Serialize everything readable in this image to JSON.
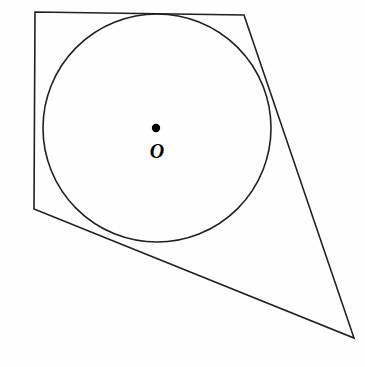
{
  "figure": {
    "background_color": "#fefefe",
    "stroke_color": "#231f20",
    "stroke_width": 1.6,
    "width": 365,
    "height": 367,
    "center_label": "O",
    "center_dot": {
      "label": "O",
      "x": 156,
      "y": 128,
      "radius": 4.2,
      "color": "#000000"
    },
    "circle": {
      "name": "inscribed-circle",
      "cx": 157,
      "cy": 128,
      "r": 114
    },
    "quadrilateral": {
      "name": "circumscribed-quadrilateral",
      "points": "35,12 244,15 354,338 34,209",
      "vertices": [
        {
          "name": "top-left",
          "x": 35,
          "y": 12
        },
        {
          "name": "top-right",
          "x": 244,
          "y": 15
        },
        {
          "name": "bottom-right",
          "x": 354,
          "y": 338
        },
        {
          "name": "bottom-left",
          "x": 34,
          "y": 209
        }
      ],
      "edges": [
        {
          "name": "top-edge",
          "from": "top-left",
          "to": "top-right"
        },
        {
          "name": "right-edge",
          "from": "top-right",
          "to": "bottom-right"
        },
        {
          "name": "bottom-edge",
          "from": "bottom-right",
          "to": "bottom-left"
        },
        {
          "name": "left-edge",
          "from": "bottom-left",
          "to": "top-left"
        }
      ]
    },
    "label_position": {
      "x": 157,
      "y": 158,
      "font_size": 20
    }
  }
}
